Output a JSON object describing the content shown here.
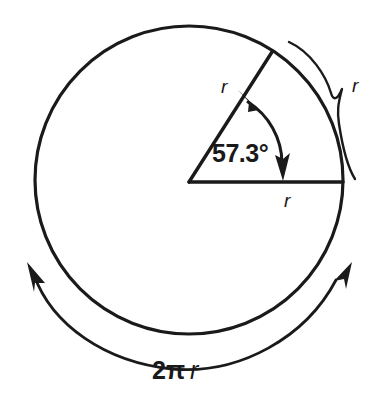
{
  "figure": {
    "background_color": "#ffffff",
    "ink_color": "#1a1a1a"
  },
  "circle": {
    "name": "main-circle",
    "center_x": 189,
    "center_y": 180,
    "radius": 154,
    "stroke_width": 3.2
  },
  "sector": {
    "angle_label": "57.3°",
    "angle_value": 57.3,
    "angle_units": "degrees",
    "start_angle_deg": 0,
    "end_angle_deg": 57.3,
    "radius_label_upper": "r",
    "radius_label_lower": "r",
    "arrow_style": "double-headed-arc"
  },
  "brace": {
    "label": "r",
    "description": "arc length equal to radius"
  },
  "circumference": {
    "label_full": "2π r",
    "label_coefficient": "2",
    "label_pi": "π",
    "label_radius": "r",
    "arrow_style": "double-headed-arc-outside"
  },
  "labels": {
    "angle": "57.3°",
    "radius_upper": "r",
    "radius_lower": "r",
    "arc_brace": "r",
    "circumference": "2π r"
  }
}
